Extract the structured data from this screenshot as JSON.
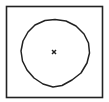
{
  "diagram": {
    "type": "geometry",
    "square": {
      "x": 6,
      "y": 6,
      "width": 97,
      "height": 92,
      "stroke": "#222222"
    },
    "circle": {
      "cx": 55,
      "cy": 53,
      "r": 34,
      "stroke": "#222222"
    },
    "center_marker": {
      "cx": 54,
      "cy": 52,
      "glyph": "x-mark",
      "color": "#222222"
    }
  }
}
